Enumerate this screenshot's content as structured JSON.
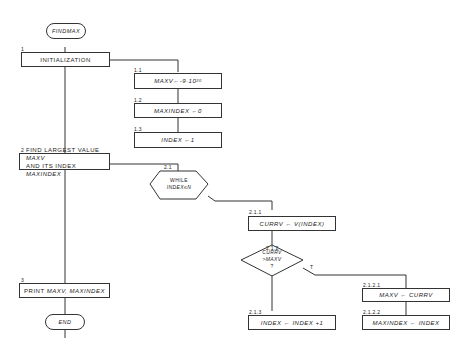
{
  "start": "FINDMAX",
  "end": "END",
  "steps": [
    {
      "num": "1",
      "text": "INITIALIZATION"
    },
    {
      "num": "1.1",
      "text": "MAXV←-9·10",
      "sup": "20"
    },
    {
      "num": "1.2",
      "text": "MAXINDEX ←0"
    },
    {
      "num": "1.3",
      "text": "INDEX ←1"
    },
    {
      "num": "2",
      "line1_a": "FIND LARGEST VALUE ",
      "line1_b": "MAXV",
      "line2_a": "AND ITS INDEX ",
      "line2_b": "MAXINDEX"
    },
    {
      "num": "2.1",
      "line1": "WHILE",
      "line2": "INDEX≤N"
    },
    {
      "num": "2.1.1",
      "text": "CURRV ← V(INDEX)"
    },
    {
      "num": "2.1.2",
      "line1": "CURRV",
      "line2": ">MAXV",
      "line3": "?",
      "true_label": "T"
    },
    {
      "num": "2.1.2.1",
      "text": "MAXV ← CURRV"
    },
    {
      "num": "2.1.2.2",
      "text": "MAXINDEX ← INDEX"
    },
    {
      "num": "2.1.3",
      "text": "INDEX ← INDEX +1"
    },
    {
      "num": "3",
      "text_a": "PRINT ",
      "text_b": "MAXV, MAXINDEX"
    }
  ]
}
